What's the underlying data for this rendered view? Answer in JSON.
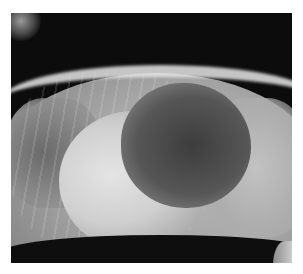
{
  "image": {
    "kind": "radiograph",
    "view": "lateral",
    "subject": "thorax and cranial abdomen",
    "text_labels": []
  },
  "colors": {
    "page_background": "#ffffff",
    "film_background": "#0c0c0c",
    "soft_tissue": "#a6a6a6",
    "bone": "#e6e6e6",
    "gas_lumen": "#3d3d3d"
  }
}
